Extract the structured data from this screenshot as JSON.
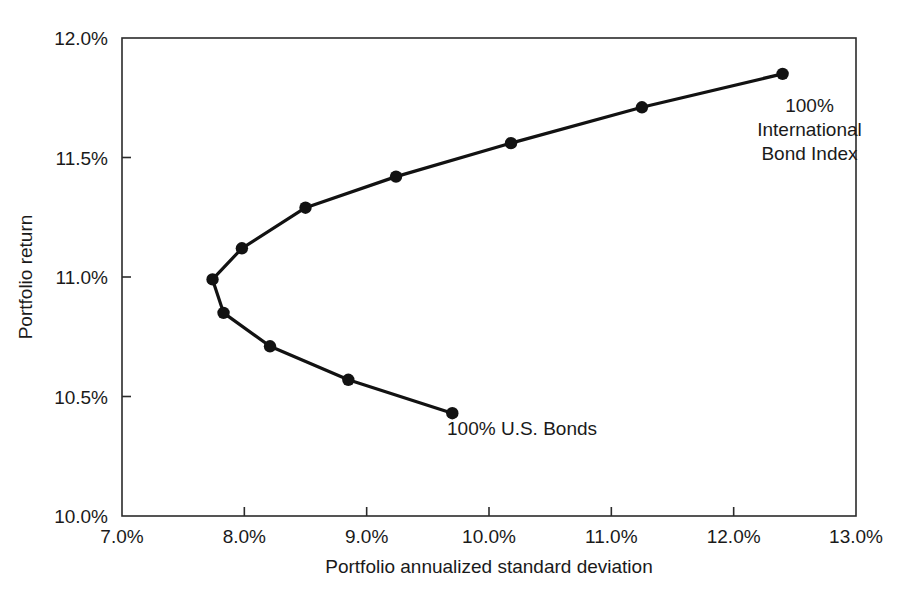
{
  "chart_data": {
    "type": "line",
    "title": "",
    "subtitle": "",
    "xlabel": "Portfolio annualized standard deviation",
    "ylabel": "Portfolio return",
    "xlim": [
      7.0,
      13.0
    ],
    "ylim": [
      10.0,
      12.0
    ],
    "grid": false,
    "legend": "none",
    "x_unit": "%",
    "y_unit": "%",
    "xticks": [
      7.0,
      8.0,
      9.0,
      10.0,
      11.0,
      12.0,
      13.0
    ],
    "yticks": [
      10.0,
      10.5,
      11.0,
      11.5,
      12.0
    ],
    "xtick_labels": [
      "7.0%",
      "8.0%",
      "9.0%",
      "10.0%",
      "11.0%",
      "12.0%",
      "13.0%"
    ],
    "ytick_labels": [
      "10.0%",
      "10.5%",
      "11.0%",
      "11.5%",
      "12.0%"
    ],
    "series": [
      {
        "name": "Efficient frontier (U.S. Bonds / International Bond Index)",
        "marker": "filled-circle",
        "color": "#121212",
        "x": [
          9.7,
          8.85,
          8.21,
          7.83,
          7.74,
          7.98,
          8.5,
          9.24,
          10.18,
          11.25,
          12.4
        ],
        "y": [
          10.43,
          10.57,
          10.71,
          10.85,
          10.99,
          11.12,
          11.29,
          11.42,
          11.56,
          11.71,
          11.85
        ]
      }
    ],
    "annotations": [
      {
        "name": "us-bonds-endpoint-label",
        "lines": [
          "100% U.S. Bonds"
        ],
        "x": 10.27,
        "y": 10.34,
        "anchor": "middle"
      },
      {
        "name": "international-bond-index-endpoint-label",
        "lines": [
          "100%",
          "International",
          "Bond Index"
        ],
        "x": 12.62,
        "y": 11.69,
        "anchor": "middle"
      }
    ]
  },
  "axes": {
    "x_axis_title": "Portfolio annualized standard deviation",
    "y_axis_title": "Portfolio return"
  }
}
